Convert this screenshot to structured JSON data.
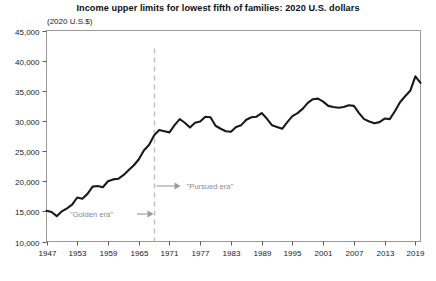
{
  "chart_data": {
    "type": "line",
    "title": "Income upper limits for lowest fifth of families: 2020 U.S. dollars",
    "subtitle": "(2020 U.S.$)",
    "xlabel": "",
    "ylabel": "",
    "ylim": [
      10000,
      45000
    ],
    "xlim": [
      1947,
      2020
    ],
    "grid": false,
    "legend": "none",
    "line_color": "#1a1a1a",
    "yticks": [
      10000,
      15000,
      20000,
      25000,
      30000,
      35000,
      40000,
      45000
    ],
    "ytick_labels": [
      "10,000",
      "15,000",
      "20,000",
      "25,000",
      "30,000",
      "35,000",
      "40,000",
      "45,000"
    ],
    "xticks": [
      1947,
      1953,
      1959,
      1965,
      1971,
      1977,
      1983,
      1989,
      1995,
      2001,
      2007,
      2013,
      2019
    ],
    "xtick_labels": [
      "1947",
      "1953",
      "1959",
      "1965",
      "1971",
      "1977",
      "1983",
      "1989",
      "1995",
      "2001",
      "2007",
      "2013",
      "2019"
    ],
    "x": [
      1947,
      1948,
      1949,
      1950,
      1951,
      1952,
      1953,
      1954,
      1955,
      1956,
      1957,
      1958,
      1959,
      1960,
      1961,
      1962,
      1963,
      1964,
      1965,
      1966,
      1967,
      1968,
      1969,
      1970,
      1971,
      1972,
      1973,
      1974,
      1975,
      1976,
      1977,
      1978,
      1979,
      1980,
      1981,
      1982,
      1983,
      1984,
      1985,
      1986,
      1987,
      1988,
      1989,
      1990,
      1991,
      1992,
      1993,
      1994,
      1995,
      1996,
      1997,
      1998,
      1999,
      2000,
      2001,
      2002,
      2003,
      2004,
      2005,
      2006,
      2007,
      2008,
      2009,
      2010,
      2011,
      2012,
      2013,
      2014,
      2015,
      2016,
      2017,
      2018,
      2019,
      2020
    ],
    "values": [
      15100,
      14900,
      14200,
      15000,
      15500,
      16100,
      17300,
      17100,
      17900,
      19100,
      19200,
      19000,
      20000,
      20300,
      20400,
      21000,
      21800,
      22600,
      23600,
      25100,
      26000,
      27600,
      28500,
      28300,
      28100,
      29300,
      30300,
      29700,
      28900,
      29700,
      29900,
      30700,
      30600,
      29200,
      28700,
      28300,
      28200,
      29000,
      29300,
      30200,
      30600,
      30700,
      31300,
      30400,
      29300,
      29000,
      28700,
      29800,
      30800,
      31300,
      32000,
      33000,
      33600,
      33700,
      33200,
      32500,
      32300,
      32200,
      32300,
      32600,
      32500,
      31300,
      30300,
      29900,
      29600,
      29800,
      30400,
      30300,
      31600,
      33100,
      34100,
      35000,
      37400,
      36300
    ],
    "annotations": [
      {
        "name": "golden-era",
        "text": "\"Golden era\"",
        "arrow_direction": "right"
      },
      {
        "name": "pursued-era",
        "text": "\"Pursued era\"",
        "arrow_direction": "right"
      }
    ],
    "vertical_marker": {
      "name": "era-divider",
      "x": 1968,
      "style": "dashed",
      "color": "#bdbdbd"
    }
  }
}
